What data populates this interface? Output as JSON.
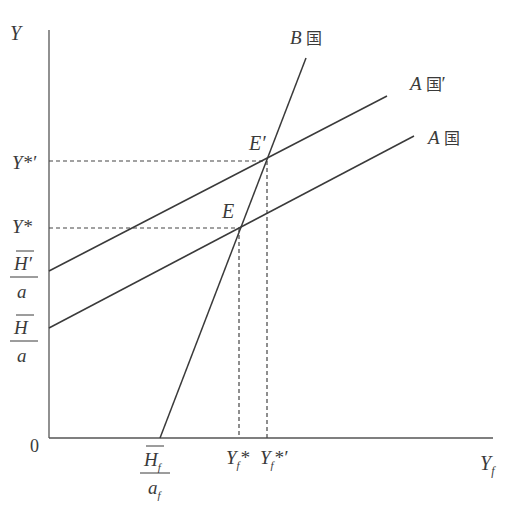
{
  "figure": {
    "title_visible": false,
    "axes": {
      "y_label": "Y",
      "x_label": "Y",
      "x_label_sub": "f",
      "origin": "0"
    },
    "y_ticks": [
      {
        "id": "y-star-prime",
        "main": "Y*′"
      },
      {
        "id": "y-star",
        "main": "Y*"
      },
      {
        "id": "h-prime-over-a",
        "num": "H′",
        "den": "a",
        "overline": true
      },
      {
        "id": "h-over-a",
        "num": "H",
        "den": "a",
        "overline": true
      }
    ],
    "x_ticks": [
      {
        "id": "hf-over-af",
        "num": "H",
        "num_sub": "f",
        "den": "a",
        "den_sub": "f",
        "overline": true
      },
      {
        "id": "yf-star",
        "main": "Y",
        "sub": "f",
        "suffix": "*"
      },
      {
        "id": "yf-star-prime",
        "main": "Y",
        "sub": "f",
        "suffix": "*′"
      }
    ],
    "lines": [
      {
        "id": "country-b",
        "label_letter": "B",
        "label_cjk": "国",
        "label_suffix": ""
      },
      {
        "id": "country-a-prime",
        "label_letter": "A",
        "label_cjk": "国",
        "label_suffix": "′"
      },
      {
        "id": "country-a",
        "label_letter": "A",
        "label_cjk": "国",
        "label_suffix": ""
      }
    ],
    "points": [
      {
        "id": "E",
        "label": "E"
      },
      {
        "id": "E-prime",
        "label": "E′"
      }
    ],
    "colors": {
      "ink": "#3a3a3a",
      "axis": "#555555"
    }
  }
}
